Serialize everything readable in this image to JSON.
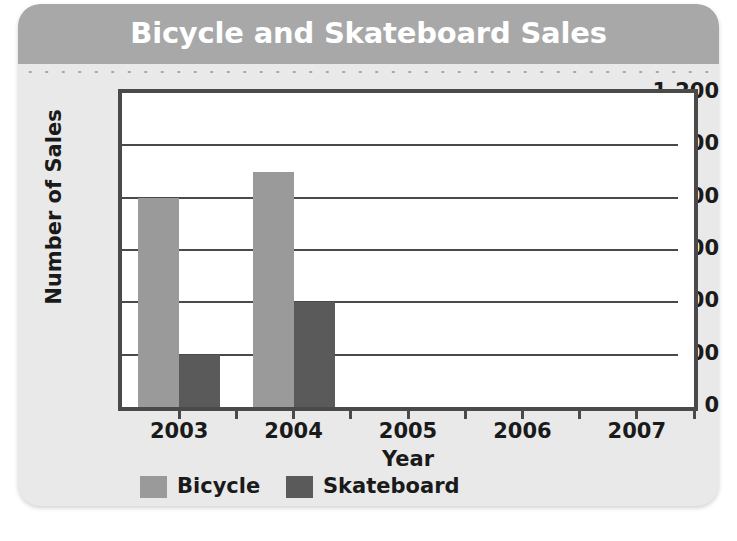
{
  "card": {
    "background": "#e9e9e9",
    "title_band_color": "#a8a8a8"
  },
  "chart_data": {
    "type": "bar",
    "title": "Bicycle and Skateboard Sales",
    "xlabel": "Year",
    "ylabel": "Number of Sales",
    "categories": [
      "2003",
      "2004",
      "2005",
      "2006",
      "2007"
    ],
    "series": [
      {
        "name": "Bicycle",
        "color": "#9a9a9a",
        "values": [
          800,
          900,
          null,
          null,
          null
        ]
      },
      {
        "name": "Skateboard",
        "color": "#5a5a5a",
        "values": [
          200,
          400,
          null,
          null,
          null
        ]
      }
    ],
    "ylim": [
      0,
      1200
    ],
    "yticks": [
      0,
      200,
      400,
      600,
      800,
      1000,
      1200
    ],
    "ytick_labels": [
      "0",
      "200",
      "400",
      "600",
      "800",
      "1,000",
      "1,200"
    ],
    "grid": true,
    "legend_position": "bottom"
  },
  "axes": {
    "y_title": "Number of Sales",
    "x_title": "Year",
    "y_tick_labels": [
      "1,200",
      "1,000",
      "800",
      "600",
      "400",
      "200",
      "0"
    ],
    "x_tick_labels": [
      "2003",
      "2004",
      "2005",
      "2006",
      "2007"
    ]
  },
  "legend": {
    "items": [
      {
        "label": "Bicycle",
        "color": "#9a9a9a"
      },
      {
        "label": "Skateboard",
        "color": "#5a5a5a"
      }
    ]
  }
}
